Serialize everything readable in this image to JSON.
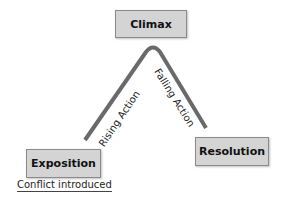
{
  "diagram": {
    "type": "plot-structure-arc",
    "nodes": {
      "climax": "Climax",
      "exposition": "Exposition",
      "resolution": "Resolution"
    },
    "edges": {
      "rising": "Rising Action",
      "falling": "Falling Action"
    },
    "note": "Conflict introduced",
    "colors": {
      "box_fill": "#d4d4d4",
      "box_border": "#8a8a8a",
      "arc": "#666666"
    }
  }
}
